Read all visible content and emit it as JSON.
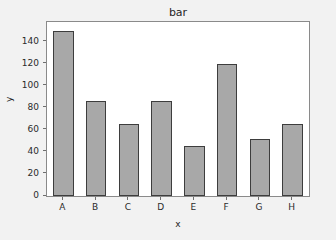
{
  "figure": {
    "background_color": "#f2f2f2",
    "plot_background_color": "#ffffff",
    "frame_color": "#8a8a8a"
  },
  "chart_data": {
    "type": "bar",
    "title": "bar",
    "xlabel": "x",
    "ylabel": "y",
    "categories": [
      "A",
      "B",
      "C",
      "D",
      "E",
      "F",
      "G",
      "H"
    ],
    "values": [
      150,
      86,
      65,
      86,
      45,
      120,
      52,
      65
    ],
    "ylim": [
      0,
      158
    ],
    "yticks": [
      0,
      20,
      40,
      60,
      80,
      100,
      120,
      140
    ],
    "ytick_labels": [
      "0",
      "20",
      "40",
      "60",
      "80",
      "100",
      "120",
      "140"
    ],
    "xtick_labels": [
      "A",
      "B",
      "C",
      "D",
      "E",
      "F",
      "G",
      "H"
    ],
    "grid": false,
    "legend": null,
    "bar_color": "#a8a8a8",
    "bar_edge_color": "#3d3d3d",
    "bar_width_ratio": 0.62
  }
}
